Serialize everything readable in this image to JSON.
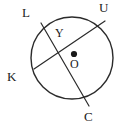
{
  "figure": {
    "kind": "circle-with-two-intersecting-chords",
    "width": 129,
    "height": 130,
    "background_color": "#ffffff",
    "stroke_color": "#2b2b2b",
    "label_color": "#1a1a1a",
    "circle": {
      "center_label": "O",
      "center_x": 72,
      "center_y": 58,
      "radius": 41,
      "stroke_width": 1.4,
      "fill": "none"
    },
    "center_dot": {
      "name": "center point marker",
      "x": 74,
      "y": 54,
      "radius": 3.1,
      "color": "#1a1a1a"
    },
    "chords": [
      {
        "name": "chord-KU",
        "from_label": "K",
        "to_label": "U",
        "x1": 34,
        "y1": 69,
        "x2": 105,
        "y2": 21
      },
      {
        "name": "chord-LC",
        "from_label": "L",
        "to_label": "C",
        "x1": 41,
        "y1": 23,
        "x2": 89,
        "y2": 106
      }
    ],
    "intersection": {
      "label": "Y",
      "x": 61,
      "y": 44
    },
    "labels": {
      "L": "L",
      "U": "U",
      "K": "K",
      "C": "C",
      "Y": "Y",
      "O": "O"
    }
  }
}
